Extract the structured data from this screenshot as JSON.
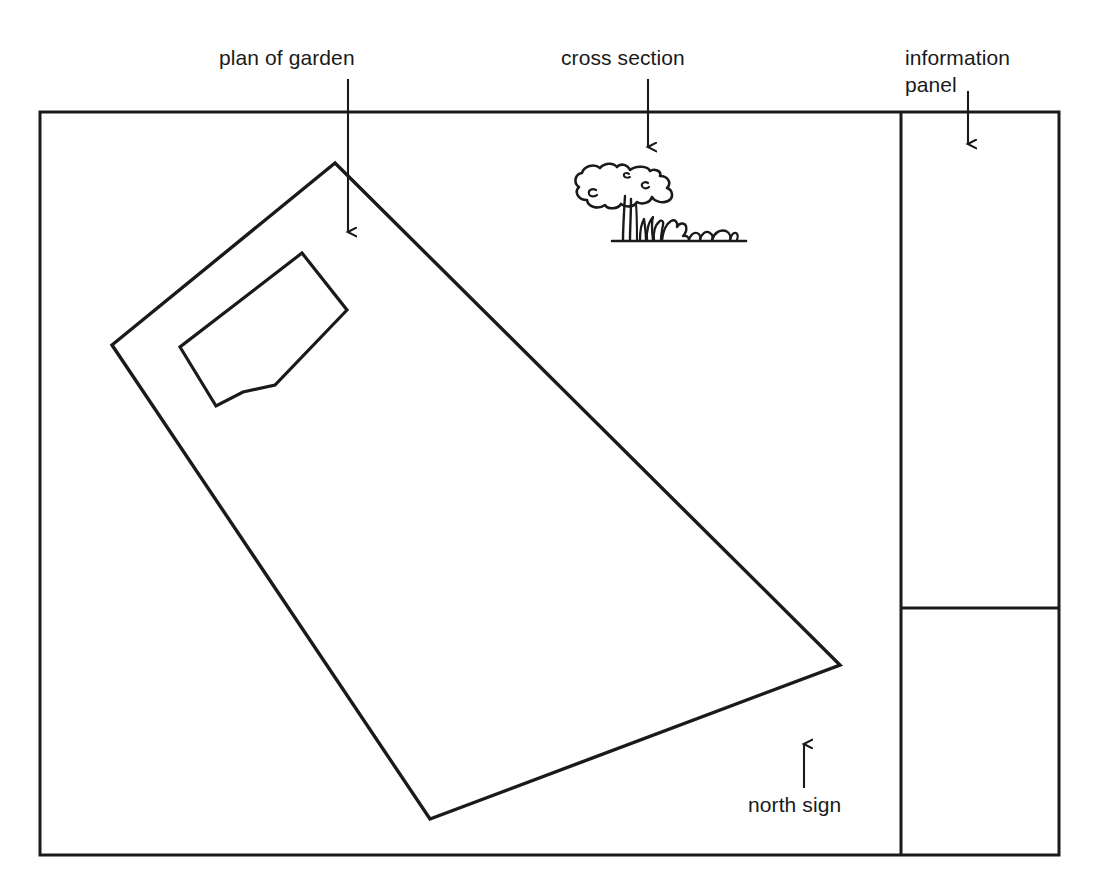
{
  "diagram": {
    "background_color": "#ffffff",
    "line_color": "#1a1a1a",
    "callouts": {
      "plan_of_garden": "plan of garden",
      "cross_section": "cross section",
      "information_panel": "information\npanel",
      "north_sign": "north sign"
    },
    "icons": {
      "arrow_down": "arrow-down-icon",
      "arrow_up": "arrow-up-icon",
      "tree": "tree-icon",
      "shrub": "shrub-icon"
    },
    "elements": {
      "outer_frame": "outer-frame",
      "garden_plot": "garden-plot-polygon",
      "building_footprint": "building-footprint-polygon",
      "panel_divider_vertical": "panel-divider-vertical",
      "panel_divider_horizontal": "panel-divider-horizontal",
      "ground_line": "ground-line"
    }
  }
}
